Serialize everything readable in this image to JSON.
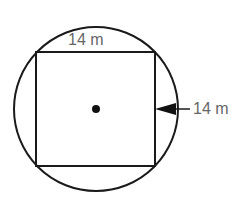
{
  "diagram": {
    "shapes": [
      "circle",
      "inscribed-square",
      "center-point"
    ],
    "top_label": "14 m",
    "side_label": "14 m",
    "colors": {
      "stroke": "#1a1a1a",
      "label": "#666666"
    }
  }
}
